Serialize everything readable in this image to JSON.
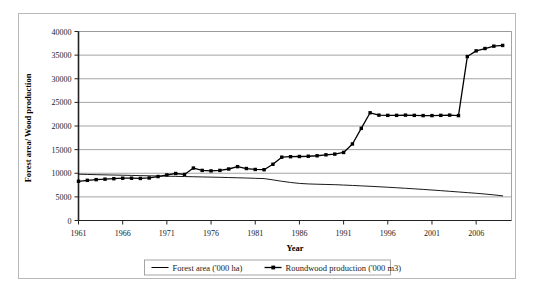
{
  "chart_data": {
    "type": "line",
    "title": "",
    "xlabel": "Year",
    "ylabel": "Forest area/ Wood production",
    "xlim": [
      1961,
      2010
    ],
    "ylim": [
      0,
      40000
    ],
    "xticks": [
      1961,
      1966,
      1971,
      1976,
      1981,
      1986,
      1991,
      1996,
      2001,
      2006
    ],
    "xtick_labels": [
      "1961",
      "1966",
      "1971",
      "1976",
      "1981",
      "1986",
      "1991",
      "1996",
      "2001",
      "2006"
    ],
    "yticks": [
      0,
      5000,
      10000,
      15000,
      20000,
      25000,
      30000,
      35000,
      40000
    ],
    "ytick_labels": [
      "0",
      "5000",
      "10000",
      "15000",
      "20000",
      "25000",
      "30000",
      "35000",
      "40000"
    ],
    "grid": "horizontal",
    "legend_position": "bottom",
    "x": [
      1961,
      1962,
      1963,
      1964,
      1965,
      1966,
      1967,
      1968,
      1969,
      1970,
      1971,
      1972,
      1973,
      1974,
      1975,
      1976,
      1977,
      1978,
      1979,
      1980,
      1981,
      1982,
      1983,
      1984,
      1985,
      1986,
      1987,
      1988,
      1989,
      1990,
      1991,
      1992,
      1993,
      1994,
      1995,
      1996,
      1997,
      1998,
      1999,
      2000,
      2001,
      2002,
      2003,
      2004,
      2005,
      2006,
      2007,
      2008,
      2009
    ],
    "series": [
      {
        "name": "Forest area ('000 ha)",
        "color": "#000000",
        "marker": "none",
        "values": [
          9800,
          9750,
          9700,
          9660,
          9620,
          9580,
          9540,
          9500,
          9460,
          9420,
          9380,
          9340,
          9300,
          9260,
          9220,
          9180,
          9140,
          9090,
          9040,
          8990,
          8930,
          8870,
          8600,
          8300,
          8050,
          7850,
          7740,
          7680,
          7630,
          7580,
          7500,
          7420,
          7330,
          7240,
          7140,
          7040,
          6930,
          6820,
          6700,
          6580,
          6450,
          6320,
          6180,
          6040,
          5900,
          5760,
          5600,
          5420,
          5220
        ]
      },
      {
        "name": "Roundwood production ('000 m3)",
        "color": "#000000",
        "marker": "square",
        "values": [
          8300,
          8500,
          8650,
          8750,
          8850,
          8950,
          8950,
          8900,
          9000,
          9300,
          9650,
          9950,
          9750,
          11100,
          10600,
          10500,
          10600,
          10900,
          11400,
          11000,
          10800,
          10750,
          11900,
          13400,
          13500,
          13550,
          13600,
          13700,
          13900,
          14050,
          14400,
          16200,
          19500,
          22800,
          22300,
          22250,
          22250,
          22300,
          22250,
          22200,
          22200,
          22250,
          22300,
          22200,
          34700,
          35900,
          36400,
          36900,
          37050
        ]
      }
    ]
  },
  "legend": {
    "items": [
      {
        "label": "Forest area ('000 ha)",
        "marker": "line"
      },
      {
        "label": "Roundwood production ('000 m3)",
        "marker": "line-square"
      }
    ]
  }
}
